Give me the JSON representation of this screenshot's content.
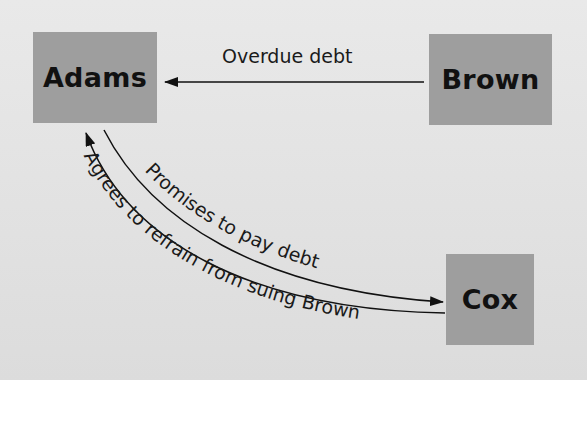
{
  "diagram": {
    "nodes": [
      {
        "id": "adams",
        "label": "Adams"
      },
      {
        "id": "brown",
        "label": "Brown"
      },
      {
        "id": "cox",
        "label": "Cox"
      }
    ],
    "edges": [
      {
        "from": "brown",
        "to": "adams",
        "label": "Overdue debt"
      },
      {
        "from": "adams",
        "to": "cox",
        "label": "Promises to pay debt"
      },
      {
        "from": "cox",
        "to": "adams",
        "label": "Agrees to refrain from suing Brown"
      }
    ],
    "colors": {
      "background_panel": "#e2e2e2",
      "box_fill": "#9e9e9e",
      "text": "#111111",
      "page": "#ffffff"
    }
  }
}
